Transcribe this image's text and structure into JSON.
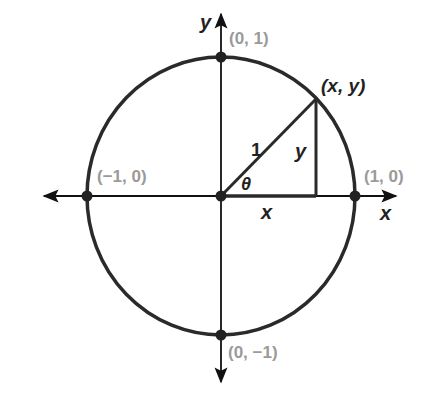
{
  "diagram": {
    "axes": {
      "x_label": "x",
      "y_label": "y"
    },
    "points": [
      {
        "name": "top",
        "label": "(0, 1)"
      },
      {
        "name": "right",
        "label": "(1, 0)"
      },
      {
        "name": "left",
        "label": "(−1, 0)"
      },
      {
        "name": "bottom",
        "label": "(0, −1)"
      },
      {
        "name": "terminal",
        "label": "(x, y)"
      }
    ],
    "triangle": {
      "hypotenuse_label": "1",
      "vertical_leg_label": "y",
      "horizontal_leg_label": "x",
      "angle_label": "θ"
    },
    "colors": {
      "line": "#2a2a2a",
      "label_gray": "#9a9a9a",
      "label_dark": "#222222"
    }
  }
}
